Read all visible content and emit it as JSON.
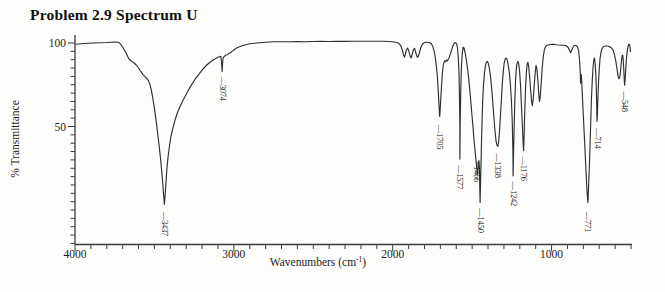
{
  "title": "Problem 2.9 Spectrum U",
  "colors": {
    "background": "#fdfdfc",
    "curve": "#2f2f2f",
    "axis": "#3c3c3c",
    "text": "#1c1c1c",
    "peak_label_text": "#222222"
  },
  "chart_data": {
    "type": "line",
    "title": "Problem 2.9 Spectrum U",
    "xlabel": "Wavenumbers (cm-1)",
    "xlabel_parts": {
      "pre": "Wavenumbers (cm",
      "sup": "-1",
      "post": ")"
    },
    "ylabel": "% Transmittance",
    "x_axis": {
      "max": 4000,
      "min": 500,
      "inverted": true,
      "major_ticks": [
        4000,
        3000,
        2000,
        1000
      ],
      "minor_tick_interval": 100
    },
    "y_axis": {
      "top": 100,
      "bottom": -20,
      "labeled_ticks": [
        100,
        50
      ],
      "minor_tick_interval": 5
    },
    "grid": false,
    "legend": false,
    "peaks": [
      {
        "wavenumber": 3437,
        "transmittance": 4
      },
      {
        "wavenumber": 3074,
        "transmittance": 83
      },
      {
        "wavenumber": 1705,
        "transmittance": 56
      },
      {
        "wavenumber": 1577,
        "transmittance": 30
      },
      {
        "wavenumber": 1466,
        "transmittance": 21
      },
      {
        "wavenumber": 1450,
        "transmittance": 4
      },
      {
        "wavenumber": 1338,
        "transmittance": 38
      },
      {
        "wavenumber": 1242,
        "transmittance": 20
      },
      {
        "wavenumber": 1176,
        "transmittance": 35
      },
      {
        "wavenumber": 771,
        "transmittance": 4
      },
      {
        "wavenumber": 714,
        "transmittance": 52
      },
      {
        "wavenumber": 548,
        "transmittance": 75
      }
    ],
    "peak_labels": [
      {
        "w": 3437,
        "label": "3437",
        "top_T": -1,
        "connector": "—"
      },
      {
        "w": 3074,
        "label": "3074",
        "top_T": 80,
        "connector": "—"
      },
      {
        "w": 1705,
        "label": "1705",
        "top_T": 51,
        "connector": "—"
      },
      {
        "w": 1577,
        "label": "1577",
        "top_T": 27,
        "connector": "—"
      },
      {
        "w": 1472,
        "label": "1466",
        "top_T": 29,
        "connector": "~"
      },
      {
        "w": 1450,
        "label": "1450",
        "top_T": 1,
        "connector": "—"
      },
      {
        "w": 1338,
        "label": "1338",
        "top_T": 34,
        "connector": "—"
      },
      {
        "w": 1242,
        "label": "1242",
        "top_T": 17,
        "connector": "—"
      },
      {
        "w": 1176,
        "label": "1176",
        "top_T": 32,
        "connector": "—"
      },
      {
        "w": 771,
        "label": "771",
        "top_T": -1,
        "connector": "—"
      },
      {
        "w": 714,
        "label": "714",
        "top_T": 49,
        "connector": "—"
      },
      {
        "w": 540,
        "label": "548",
        "top_T": 71,
        "connector": "—"
      }
    ],
    "layout": {
      "x_px_at_max": 75,
      "x_px_at_min": 631,
      "y_px_at_100": 43,
      "y_px_per_percent": 1.67,
      "axis_y_px": 244.5,
      "y_axis_top_px": 35,
      "x_tick_label_y": 258,
      "xlabel_cx": 318,
      "xlabel_y": 266,
      "ylabel_cx": 19,
      "ylabel_cy": 139
    },
    "points": [
      [
        3995,
        99.3
      ],
      [
        3960,
        99.5
      ],
      [
        3920,
        99.8
      ],
      [
        3880,
        100
      ],
      [
        3840,
        100.2
      ],
      [
        3800,
        100.3
      ],
      [
        3770,
        100.5
      ],
      [
        3745,
        100.6
      ],
      [
        3725,
        100.4
      ],
      [
        3710,
        99
      ],
      [
        3700,
        97.5
      ],
      [
        3690,
        96
      ],
      [
        3678,
        94
      ],
      [
        3668,
        92
      ],
      [
        3660,
        90.5
      ],
      [
        3650,
        89.5
      ],
      [
        3640,
        88.8
      ],
      [
        3628,
        88
      ],
      [
        3615,
        86.8
      ],
      [
        3600,
        85
      ],
      [
        3585,
        82.8
      ],
      [
        3572,
        81
      ],
      [
        3560,
        79.8
      ],
      [
        3550,
        79
      ],
      [
        3540,
        77.8
      ],
      [
        3530,
        75.5
      ],
      [
        3520,
        72
      ],
      [
        3510,
        67
      ],
      [
        3500,
        61
      ],
      [
        3490,
        54
      ],
      [
        3480,
        46
      ],
      [
        3470,
        38
      ],
      [
        3462,
        31
      ],
      [
        3455,
        24
      ],
      [
        3448,
        16
      ],
      [
        3442,
        9
      ],
      [
        3437,
        3.5
      ],
      [
        3433,
        9
      ],
      [
        3428,
        16
      ],
      [
        3422,
        24
      ],
      [
        3415,
        31
      ],
      [
        3406,
        38
      ],
      [
        3396,
        44
      ],
      [
        3384,
        49
      ],
      [
        3370,
        54
      ],
      [
        3354,
        58.5
      ],
      [
        3336,
        62.5
      ],
      [
        3316,
        66.5
      ],
      [
        3294,
        70.5
      ],
      [
        3270,
        74.5
      ],
      [
        3246,
        78
      ],
      [
        3222,
        81
      ],
      [
        3198,
        84
      ],
      [
        3174,
        86.5
      ],
      [
        3150,
        88.5
      ],
      [
        3128,
        90
      ],
      [
        3108,
        91
      ],
      [
        3092,
        91.8
      ],
      [
        3082,
        92
      ],
      [
        3078,
        89
      ],
      [
        3074,
        83
      ],
      [
        3071,
        88
      ],
      [
        3068,
        91
      ],
      [
        3060,
        92
      ],
      [
        3050,
        92.8
      ],
      [
        3040,
        93
      ],
      [
        3032,
        93.8
      ],
      [
        3022,
        94.2
      ],
      [
        3012,
        95
      ],
      [
        3000,
        95.8
      ],
      [
        2985,
        96.8
      ],
      [
        2968,
        97.6
      ],
      [
        2948,
        98.4
      ],
      [
        2925,
        99
      ],
      [
        2900,
        99.5
      ],
      [
        2870,
        99.9
      ],
      [
        2840,
        100.2
      ],
      [
        2800,
        100.5
      ],
      [
        2750,
        100.7
      ],
      [
        2700,
        100.8
      ],
      [
        2650,
        100.8
      ],
      [
        2600,
        100.9
      ],
      [
        2550,
        100.8
      ],
      [
        2500,
        100.9
      ],
      [
        2450,
        101
      ],
      [
        2400,
        100.9
      ],
      [
        2350,
        101
      ],
      [
        2300,
        101
      ],
      [
        2250,
        101.1
      ],
      [
        2200,
        101
      ],
      [
        2150,
        101.1
      ],
      [
        2100,
        101.1
      ],
      [
        2060,
        101
      ],
      [
        2020,
        100.9
      ],
      [
        1990,
        100.6
      ],
      [
        1965,
        100
      ],
      [
        1950,
        98.5
      ],
      [
        1940,
        96
      ],
      [
        1932,
        93
      ],
      [
        1926,
        91.5
      ],
      [
        1920,
        93.5
      ],
      [
        1913,
        96
      ],
      [
        1906,
        97
      ],
      [
        1898,
        95
      ],
      [
        1890,
        92
      ],
      [
        1884,
        91
      ],
      [
        1877,
        93.5
      ],
      [
        1870,
        96
      ],
      [
        1862,
        96.8
      ],
      [
        1854,
        94
      ],
      [
        1846,
        91.5
      ],
      [
        1840,
        91.8
      ],
      [
        1832,
        94
      ],
      [
        1824,
        97
      ],
      [
        1815,
        99
      ],
      [
        1805,
        100
      ],
      [
        1793,
        100.4
      ],
      [
        1780,
        100.5
      ],
      [
        1768,
        100.3
      ],
      [
        1757,
        99.5
      ],
      [
        1748,
        98
      ],
      [
        1740,
        95.5
      ],
      [
        1733,
        92
      ],
      [
        1726,
        87
      ],
      [
        1720,
        81
      ],
      [
        1714,
        73
      ],
      [
        1709,
        64
      ],
      [
        1706,
        58
      ],
      [
        1704,
        56
      ],
      [
        1701,
        60
      ],
      [
        1697,
        67
      ],
      [
        1692,
        75
      ],
      [
        1687,
        82
      ],
      [
        1682,
        86.5
      ],
      [
        1677,
        88.5
      ],
      [
        1672,
        89.3
      ],
      [
        1667,
        88.7
      ],
      [
        1662,
        89.8
      ],
      [
        1656,
        89.2
      ],
      [
        1650,
        90.3
      ],
      [
        1644,
        91.5
      ],
      [
        1637,
        93.5
      ],
      [
        1629,
        96
      ],
      [
        1621,
        98.3
      ],
      [
        1613,
        99.8
      ],
      [
        1605,
        100.3
      ],
      [
        1598,
        99.5
      ],
      [
        1592,
        97
      ],
      [
        1587,
        91
      ],
      [
        1583,
        82
      ],
      [
        1580,
        70
      ],
      [
        1578,
        55
      ],
      [
        1577,
        30.5
      ],
      [
        1575,
        52
      ],
      [
        1572,
        70
      ],
      [
        1569,
        82
      ],
      [
        1565,
        90
      ],
      [
        1561,
        95
      ],
      [
        1556,
        97.5
      ],
      [
        1551,
        97
      ],
      [
        1544,
        94
      ],
      [
        1536,
        89.5
      ],
      [
        1528,
        84
      ],
      [
        1520,
        77
      ],
      [
        1512,
        69
      ],
      [
        1504,
        60
      ],
      [
        1496,
        51
      ],
      [
        1488,
        42
      ],
      [
        1480,
        34
      ],
      [
        1473,
        27
      ],
      [
        1468,
        22.5
      ],
      [
        1466,
        21.5
      ],
      [
        1463,
        25
      ],
      [
        1460,
        28.5
      ],
      [
        1457,
        29.5
      ],
      [
        1454,
        24
      ],
      [
        1451,
        10
      ],
      [
        1450,
        4.5
      ],
      [
        1448,
        12
      ],
      [
        1445,
        25
      ],
      [
        1442,
        38
      ],
      [
        1438,
        52
      ],
      [
        1434,
        64
      ],
      [
        1429,
        74
      ],
      [
        1423,
        81.5
      ],
      [
        1417,
        86
      ],
      [
        1411,
        88.3
      ],
      [
        1405,
        89
      ],
      [
        1399,
        88
      ],
      [
        1392,
        85
      ],
      [
        1385,
        80.5
      ],
      [
        1378,
        74
      ],
      [
        1371,
        66
      ],
      [
        1364,
        57
      ],
      [
        1357,
        48
      ],
      [
        1350,
        41.5
      ],
      [
        1344,
        38.8
      ],
      [
        1338,
        38
      ],
      [
        1333,
        41
      ],
      [
        1328,
        47
      ],
      [
        1322,
        56
      ],
      [
        1316,
        66
      ],
      [
        1310,
        75.5
      ],
      [
        1304,
        83
      ],
      [
        1298,
        88
      ],
      [
        1292,
        90.3
      ],
      [
        1286,
        91
      ],
      [
        1280,
        90.3
      ],
      [
        1274,
        87.5
      ],
      [
        1267,
        83
      ],
      [
        1260,
        76
      ],
      [
        1253,
        66
      ],
      [
        1247,
        52
      ],
      [
        1243,
        32
      ],
      [
        1242,
        20.5
      ],
      [
        1239,
        35
      ],
      [
        1235,
        52
      ],
      [
        1231,
        66
      ],
      [
        1227,
        77
      ],
      [
        1222,
        84.5
      ],
      [
        1217,
        88
      ],
      [
        1212,
        89
      ],
      [
        1207,
        87.5
      ],
      [
        1201,
        83
      ],
      [
        1195,
        74
      ],
      [
        1189,
        62
      ],
      [
        1183,
        49
      ],
      [
        1178,
        38
      ],
      [
        1176,
        35.5
      ],
      [
        1173,
        44
      ],
      [
        1169,
        58
      ],
      [
        1164,
        72
      ],
      [
        1159,
        82
      ],
      [
        1154,
        87
      ],
      [
        1149,
        88.5
      ],
      [
        1144,
        86
      ],
      [
        1138,
        80
      ],
      [
        1132,
        72
      ],
      [
        1126,
        65
      ],
      [
        1121,
        62.5
      ],
      [
        1116,
        66
      ],
      [
        1110,
        74
      ],
      [
        1104,
        81.5
      ],
      [
        1098,
        86.5
      ],
      [
        1093,
        85
      ],
      [
        1087,
        78
      ],
      [
        1081,
        70
      ],
      [
        1076,
        65
      ],
      [
        1072,
        67
      ],
      [
        1066,
        75
      ],
      [
        1059,
        85
      ],
      [
        1052,
        92
      ],
      [
        1045,
        96
      ],
      [
        1038,
        97.8
      ],
      [
        1028,
        98.6
      ],
      [
        1015,
        99
      ],
      [
        1000,
        99.2
      ],
      [
        985,
        99.2
      ],
      [
        970,
        99
      ],
      [
        955,
        98.8
      ],
      [
        940,
        98.7
      ],
      [
        925,
        98.6
      ],
      [
        910,
        98.5
      ],
      [
        898,
        97.6
      ],
      [
        888,
        95.8
      ],
      [
        881,
        94.2
      ],
      [
        875,
        95
      ],
      [
        868,
        97
      ],
      [
        860,
        98.2
      ],
      [
        852,
        98.6
      ],
      [
        844,
        98.4
      ],
      [
        836,
        97.5
      ],
      [
        829,
        95
      ],
      [
        824,
        90
      ],
      [
        820,
        83
      ],
      [
        817,
        76
      ],
      [
        815,
        79
      ],
      [
        813,
        81
      ],
      [
        810,
        76
      ],
      [
        806,
        68
      ],
      [
        801,
        58
      ],
      [
        795,
        47
      ],
      [
        789,
        35
      ],
      [
        783,
        23
      ],
      [
        777,
        11
      ],
      [
        772,
        5
      ],
      [
        771,
        4.5
      ],
      [
        768,
        11
      ],
      [
        764,
        22
      ],
      [
        759,
        36
      ],
      [
        754,
        52
      ],
      [
        749,
        66
      ],
      [
        744,
        77
      ],
      [
        739,
        85
      ],
      [
        734,
        90
      ],
      [
        730,
        91
      ],
      [
        726,
        88
      ],
      [
        721,
        80
      ],
      [
        717,
        68
      ],
      [
        714,
        53
      ],
      [
        712,
        56
      ],
      [
        709,
        65
      ],
      [
        705,
        75
      ],
      [
        700,
        84
      ],
      [
        695,
        90.5
      ],
      [
        689,
        94.5
      ],
      [
        683,
        96.5
      ],
      [
        676,
        97.6
      ],
      [
        668,
        98
      ],
      [
        659,
        98.2
      ],
      [
        650,
        98.2
      ],
      [
        641,
        98
      ],
      [
        632,
        97.6
      ],
      [
        623,
        97
      ],
      [
        614,
        96
      ],
      [
        605,
        93.5
      ],
      [
        596,
        89.5
      ],
      [
        588,
        84.5
      ],
      [
        581,
        80
      ],
      [
        575,
        78.6
      ],
      [
        570,
        80
      ],
      [
        565,
        84.5
      ],
      [
        560,
        89.5
      ],
      [
        556,
        92.3
      ],
      [
        552,
        92.8
      ],
      [
        549,
        90
      ],
      [
        546,
        85
      ],
      [
        543,
        79
      ],
      [
        540,
        74.8
      ],
      [
        537,
        78
      ],
      [
        533,
        84.5
      ],
      [
        529,
        90.5
      ],
      [
        524,
        95
      ],
      [
        519,
        97.8
      ],
      [
        513,
        99.3
      ],
      [
        508,
        99
      ],
      [
        505,
        96.5
      ],
      [
        503,
        94.8
      ]
    ]
  }
}
